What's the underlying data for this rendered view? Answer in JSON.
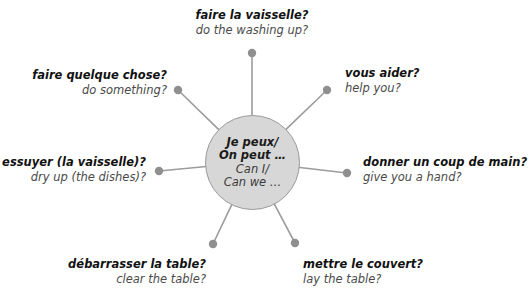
{
  "diagram": {
    "type": "mind-map",
    "hub": {
      "french_line1": "Je peux/",
      "french_line2": "On peut …",
      "english_line1": "Can I/",
      "english_line2": "Can we …",
      "fill_color": "#d7d7d7",
      "border_color": "#9a9a9a",
      "center_x": 252,
      "center_y": 162,
      "radius": 47
    },
    "style": {
      "spoke_color": "#9c9c9c",
      "dot_color": "#8f8f8f",
      "text_color_french": "#111111",
      "text_color_english": "#4a4a4a",
      "background": "#ffffff"
    },
    "nodes": [
      {
        "id": "faire-la-vaisselle",
        "french": "faire la vaisselle?",
        "english": "do the washing up?",
        "dot_x": 252,
        "dot_y": 53,
        "label_x": 252,
        "label_y": 8,
        "align": "center"
      },
      {
        "id": "vous-aider",
        "french": "vous aider?",
        "english": "help you?",
        "dot_x": 327,
        "dot_y": 90,
        "label_x": 345,
        "label_y": 66,
        "align": "left"
      },
      {
        "id": "donner-un-coup-de-main",
        "french": "donner un coup de main?",
        "english": "give you a hand?",
        "dot_x": 347,
        "dot_y": 173,
        "label_x": 363,
        "label_y": 155,
        "align": "left"
      },
      {
        "id": "mettre-le-couvert",
        "french": "mettre le couvert?",
        "english": "lay the table?",
        "dot_x": 295,
        "dot_y": 243,
        "label_x": 303,
        "label_y": 257,
        "align": "left"
      },
      {
        "id": "debarrasser-la-table",
        "french": "débarrasser la table?",
        "english": "clear the table?",
        "dot_x": 213,
        "dot_y": 244,
        "label_x": 206,
        "label_y": 257,
        "align": "right"
      },
      {
        "id": "essuyer-la-vaisselle",
        "french": "essuyer (la vaisselle)?",
        "english": "dry up (the dishes)?",
        "dot_x": 159,
        "dot_y": 171,
        "label_x": 146,
        "label_y": 155,
        "align": "right"
      },
      {
        "id": "faire-quelque-chose",
        "french": "faire quelque chose?",
        "english": "do something?",
        "dot_x": 178,
        "dot_y": 90,
        "label_x": 167,
        "label_y": 68,
        "align": "right"
      }
    ]
  }
}
